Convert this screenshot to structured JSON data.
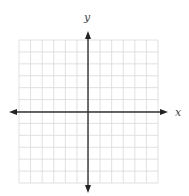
{
  "diagram": {
    "type": "coordinate-plane",
    "x_axis_label": "x",
    "y_axis_label": "y",
    "grid": {
      "columns": 12,
      "rows": 12,
      "left": 19,
      "top": 40,
      "right": 158,
      "bottom": 183
    },
    "origin": {
      "x": 88,
      "y": 112
    },
    "colors": {
      "grid": "#d9d9d9",
      "axis": "#333333",
      "label": "#444444"
    }
  }
}
